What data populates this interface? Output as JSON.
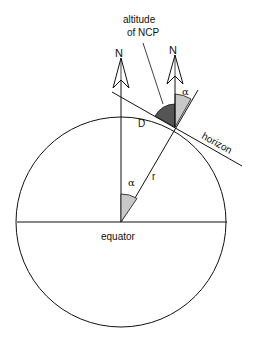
{
  "labels": {
    "altitude_line1": "altitude",
    "altitude_line2": "of NCP",
    "north_left": "N",
    "north_right": "N",
    "alpha_top": "α",
    "alpha_center": "α",
    "point_d": "D",
    "horizon": "horizon",
    "radius": "r",
    "equator": "equator"
  },
  "colors": {
    "stroke": "#111111",
    "altitude_fill": "#555555",
    "alpha_fill": "#c8c8c8"
  }
}
